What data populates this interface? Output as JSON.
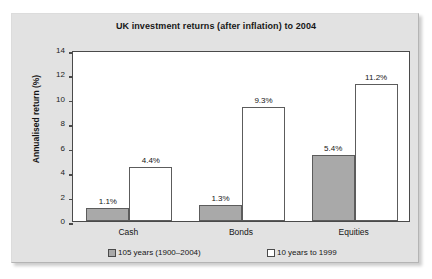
{
  "chart_data": {
    "type": "bar",
    "title": "UK investment returns (after inflation) to 2004",
    "xlabel": "",
    "ylabel": "Annualised return (%)",
    "categories": [
      "Cash",
      "Bonds",
      "Equities"
    ],
    "ylim": [
      0,
      14
    ],
    "yticks": [
      0,
      2,
      4,
      6,
      8,
      10,
      12,
      14
    ],
    "ytick_labels": [
      "0",
      "2",
      "4",
      "6",
      "8",
      "10",
      "12",
      "14"
    ],
    "grid": false,
    "legend_position": "bottom",
    "series": [
      {
        "name": "105 years (1900–2004)",
        "color": "#a9a9a9",
        "values": [
          1.1,
          1.3,
          5.4
        ],
        "labels": [
          "1.1%",
          "1.3%",
          "5.4%"
        ]
      },
      {
        "name": "10 years to 1999",
        "color": "#ffffff",
        "values": [
          4.4,
          9.3,
          11.2
        ],
        "labels": [
          "4.4%",
          "9.3%",
          "11.2%"
        ]
      }
    ]
  },
  "figure": {
    "panel_color": "#e2e2e2",
    "plot_background": "#ffffff",
    "axis_color": "#4a4a4a",
    "bar_edge_color": "#5c5c5c"
  }
}
